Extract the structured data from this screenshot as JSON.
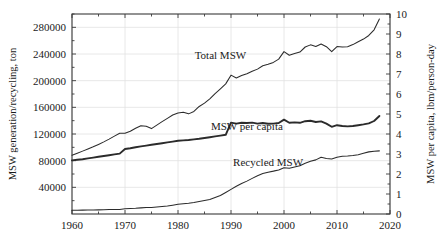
{
  "chart_data": {
    "type": "line",
    "title": "",
    "xlabel": "",
    "ylabel": "MSW generation/recycling, ton",
    "y2label": "MSW per capita, lbm/person-day",
    "xlim": [
      1960,
      2020
    ],
    "ylim": [
      0,
      300000
    ],
    "y2lim": [
      0,
      10
    ],
    "grid": true,
    "legend": "inline-annotations",
    "xticks": [
      1960,
      1970,
      1980,
      1990,
      2000,
      2010,
      2020
    ],
    "xticklabels": [
      "1960",
      "1970",
      "1980",
      "1990",
      "2000",
      "2010",
      "2020"
    ],
    "yticks": [
      40000,
      80000,
      120000,
      160000,
      200000,
      240000,
      280000
    ],
    "yticklabels": [
      "40000",
      "80000",
      "120000",
      "160000",
      "200000",
      "240000",
      "280000"
    ],
    "y2ticks": [
      0,
      1,
      2,
      3,
      4,
      5,
      6,
      7,
      8,
      9,
      10
    ],
    "y2ticklabels": [
      "0",
      "1",
      "2",
      "3",
      "4",
      "5",
      "6",
      "7",
      "8",
      "9",
      "10"
    ],
    "annotations": [
      {
        "text": "Total MSW",
        "x": 1988,
        "y": 232000
      },
      {
        "text": "MSW per capita",
        "x": 1993,
        "y": 126000
      },
      {
        "text": "Recycled MSW",
        "x": 1997,
        "y": 72000
      }
    ],
    "series": [
      {
        "name": "Total MSW",
        "axis": "left",
        "units": "ton",
        "x": [
          1960,
          1961,
          1962,
          1963,
          1964,
          1965,
          1966,
          1967,
          1968,
          1969,
          1970,
          1971,
          1972,
          1973,
          1974,
          1975,
          1976,
          1977,
          1978,
          1979,
          1980,
          1981,
          1982,
          1983,
          1984,
          1985,
          1986,
          1987,
          1988,
          1989,
          1990,
          1991,
          1992,
          1993,
          1994,
          1995,
          1996,
          1997,
          1998,
          1999,
          2000,
          2001,
          2002,
          2003,
          2004,
          2005,
          2006,
          2007,
          2008,
          2009,
          2010,
          2011,
          2012,
          2013,
          2014,
          2015,
          2016,
          2017,
          2018
        ],
        "values": [
          88120,
          91200,
          94300,
          97500,
          100800,
          104400,
          108200,
          112300,
          116800,
          121000,
          121060,
          124000,
          128500,
          132400,
          131500,
          128100,
          133300,
          138500,
          143400,
          148500,
          151640,
          152500,
          150200,
          153800,
          161300,
          166300,
          172800,
          180500,
          187700,
          195200,
          208270,
          204000,
          207700,
          210500,
          214200,
          217300,
          222400,
          224600,
          227400,
          232300,
          243500,
          238100,
          240600,
          242900,
          250500,
          253700,
          251300,
          255000,
          251000,
          243500,
          251100,
          250400,
          251000,
          254100,
          258500,
          262400,
          267800,
          276300,
          292400
        ]
      },
      {
        "name": "MSW per capita",
        "axis": "right",
        "units": "lbm/person-day",
        "x": [
          1960,
          1961,
          1962,
          1963,
          1964,
          1965,
          1966,
          1967,
          1968,
          1969,
          1970,
          1971,
          1972,
          1973,
          1974,
          1975,
          1976,
          1977,
          1978,
          1979,
          1980,
          1981,
          1982,
          1983,
          1984,
          1985,
          1986,
          1987,
          1988,
          1989,
          1990,
          1991,
          1992,
          1993,
          1994,
          1995,
          1996,
          1997,
          1998,
          1999,
          2000,
          2001,
          2002,
          2003,
          2004,
          2005,
          2006,
          2007,
          2008,
          2009,
          2010,
          2011,
          2012,
          2013,
          2014,
          2015,
          2016,
          2017,
          2018
        ],
        "values": [
          2.68,
          2.71,
          2.74,
          2.78,
          2.82,
          2.86,
          2.9,
          2.94,
          2.98,
          3.02,
          3.25,
          3.29,
          3.34,
          3.38,
          3.42,
          3.46,
          3.5,
          3.54,
          3.58,
          3.62,
          3.66,
          3.68,
          3.7,
          3.73,
          3.76,
          3.8,
          3.84,
          3.88,
          3.92,
          3.96,
          4.57,
          4.52,
          4.56,
          4.55,
          4.57,
          4.52,
          4.55,
          4.51,
          4.52,
          4.55,
          4.72,
          4.56,
          4.58,
          4.56,
          4.64,
          4.66,
          4.6,
          4.63,
          4.52,
          4.36,
          4.44,
          4.4,
          4.38,
          4.4,
          4.44,
          4.48,
          4.53,
          4.65,
          4.9
        ]
      },
      {
        "name": "Recycled MSW",
        "axis": "left",
        "units": "ton",
        "x": [
          1960,
          1961,
          1962,
          1963,
          1964,
          1965,
          1966,
          1967,
          1968,
          1969,
          1970,
          1971,
          1972,
          1973,
          1974,
          1975,
          1976,
          1977,
          1978,
          1979,
          1980,
          1981,
          1982,
          1983,
          1984,
          1985,
          1986,
          1987,
          1988,
          1989,
          1990,
          1991,
          1992,
          1993,
          1994,
          1995,
          1996,
          1997,
          1998,
          1999,
          2000,
          2001,
          2002,
          2003,
          2004,
          2005,
          2006,
          2007,
          2008,
          2009,
          2010,
          2011,
          2012,
          2013,
          2014,
          2015,
          2016,
          2017,
          2018
        ],
        "values": [
          5610,
          5700,
          5800,
          5900,
          6000,
          6200,
          6400,
          6600,
          6700,
          6800,
          8020,
          8300,
          8600,
          9200,
          9800,
          9700,
          10400,
          11200,
          12000,
          13200,
          14520,
          15300,
          16100,
          17200,
          18700,
          20100,
          21600,
          24800,
          27800,
          32300,
          36990,
          41500,
          45800,
          49300,
          53400,
          57500,
          60800,
          62700,
          64300,
          66100,
          69500,
          68500,
          70400,
          72300,
          76100,
          79000,
          81200,
          85000,
          83100,
          82400,
          85100,
          86500,
          87000,
          87800,
          89000,
          91000,
          93200,
          94200,
          94700
        ]
      }
    ]
  },
  "axes": {
    "left_title": "MSW generation/recycling, ton",
    "right_title": "MSW per capita, lbm/person-day"
  },
  "style": {
    "line_color": "#2b2b2b",
    "grid_color": "#e2e2e2",
    "frame_color": "#3a3a3a"
  }
}
